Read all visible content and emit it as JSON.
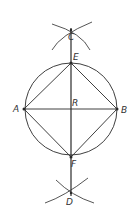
{
  "diagram": {
    "title": "",
    "stroke_color": "#2a2a2a",
    "label_color": "#333333",
    "circle": {
      "cx": 71,
      "cy": 109,
      "r": 46
    },
    "points": {
      "A": {
        "x": 24,
        "y": 109,
        "label": "A",
        "lx": 13,
        "ly": 112
      },
      "B": {
        "x": 117,
        "y": 109,
        "label": "B",
        "lx": 121,
        "ly": 113
      },
      "C": {
        "x": 71,
        "y": 30,
        "label": "C",
        "lx": 68,
        "ly": 40
      },
      "D": {
        "x": 71,
        "y": 193,
        "label": "D",
        "lx": 66,
        "ly": 205
      },
      "E": {
        "x": 71,
        "y": 63,
        "label": "E",
        "lx": 73,
        "ly": 60
      },
      "F": {
        "x": 71,
        "y": 157,
        "label": "F",
        "lx": 71,
        "ly": 167
      },
      "R": {
        "x": 71,
        "y": 109,
        "label": "R",
        "lx": 72,
        "ly": 106
      }
    },
    "labels": {
      "A": "A",
      "B": "B",
      "C": "C",
      "D": "D",
      "E": "E",
      "F": "F",
      "R": "R"
    }
  }
}
